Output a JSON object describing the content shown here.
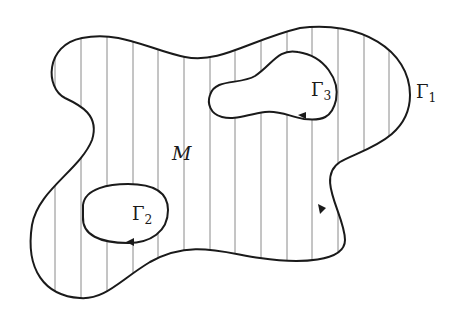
{
  "diagram": {
    "manifold_label": "M",
    "boundaries": [
      {
        "id": "gamma-1",
        "symbol": "Γ",
        "subscript": "1",
        "role": "outer boundary"
      },
      {
        "id": "gamma-2",
        "symbol": "Γ",
        "subscript": "2",
        "role": "inner hole (lower-left)"
      },
      {
        "id": "gamma-3",
        "symbol": "Γ",
        "subscript": "3",
        "role": "inner hole (upper-right)"
      }
    ],
    "colors": {
      "stroke": "#1a1a1a",
      "hatch": "#8a8a8a",
      "background": "#ffffff"
    }
  }
}
